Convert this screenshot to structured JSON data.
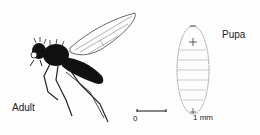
{
  "figure": {
    "labels": {
      "adult": "Adult",
      "pupa": "Pupa"
    },
    "scale_bar": {
      "start_label": "0",
      "end_label": "1 mm"
    },
    "colors": {
      "ink": "#111111",
      "background": "#fdfdfd",
      "line": "#555555"
    }
  }
}
